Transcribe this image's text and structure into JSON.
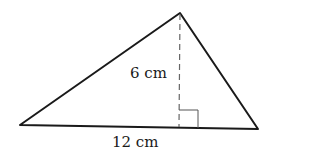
{
  "diagram": {
    "type": "triangle",
    "vertices": {
      "left": [
        20,
        125
      ],
      "top": [
        180,
        13
      ],
      "right": [
        258,
        129
      ]
    },
    "height_label": "6 cm",
    "base_label": "12 cm",
    "height_value": 6,
    "base_value": 12,
    "unit": "cm",
    "right_angle_marker": true,
    "altitude_style": "dashed",
    "colors": {
      "stroke": "#1a1a1a",
      "altitude": "#555555",
      "background": "#ffffff"
    }
  }
}
